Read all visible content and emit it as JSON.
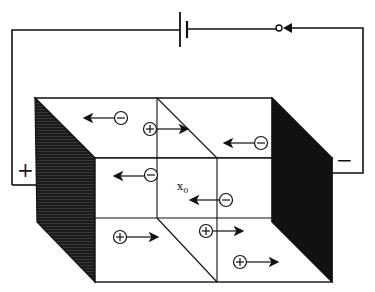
{
  "diagram": {
    "terminals": {
      "positive_label": "+",
      "negative_label": "−"
    },
    "position_label": "x",
    "position_subscript": "0",
    "circuit": {
      "components": [
        "battery",
        "switch"
      ]
    },
    "carriers": [
      {
        "sign": "−",
        "direction": "left",
        "x": 121,
        "y": 118
      },
      {
        "sign": "+",
        "direction": "right",
        "x": 150,
        "y": 129
      },
      {
        "sign": "−",
        "direction": "left",
        "x": 261,
        "y": 143
      },
      {
        "sign": "−",
        "direction": "left",
        "x": 151,
        "y": 175
      },
      {
        "sign": "−",
        "direction": "left",
        "x": 226,
        "y": 200
      },
      {
        "sign": "+",
        "direction": "right",
        "x": 120,
        "y": 237
      },
      {
        "sign": "+",
        "direction": "right",
        "x": 206,
        "y": 231
      },
      {
        "sign": "+",
        "direction": "right",
        "x": 240,
        "y": 262
      }
    ]
  }
}
